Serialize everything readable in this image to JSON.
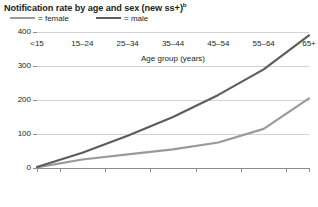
{
  "chart_data": {
    "type": "line",
    "title": "Notification rate by age and sex (new ss+)",
    "title_superscript": "b",
    "xlabel": "Age group (years)",
    "ylabel": "",
    "categories": [
      "<15",
      "15–24",
      "25–34",
      "35–44",
      "45–54",
      "55–64",
      "65+"
    ],
    "ylim": [
      0,
      400
    ],
    "yticks": [
      0,
      100,
      200,
      300,
      400
    ],
    "ytick_labels": [
      "0",
      "100",
      "200",
      "300",
      "400"
    ],
    "grid": true,
    "legend_position": "top-left",
    "series": [
      {
        "name": "female",
        "color": "#9a9a9a",
        "values": [
          2,
          25,
          40,
          55,
          75,
          115,
          205
        ]
      },
      {
        "name": "male",
        "color": "#5d5d5d",
        "values": [
          3,
          45,
          95,
          150,
          215,
          290,
          390
        ]
      }
    ]
  },
  "legend": {
    "female_equals": "=",
    "female_label": "female",
    "male_equals": "=",
    "male_label": "male"
  },
  "colors": {
    "female_line": "#9a9a9a",
    "male_line": "#5d5d5d",
    "gridline": "#d4d4d4",
    "axis": "#8c8c8c",
    "text": "#231f20",
    "background": "#ffffff"
  }
}
